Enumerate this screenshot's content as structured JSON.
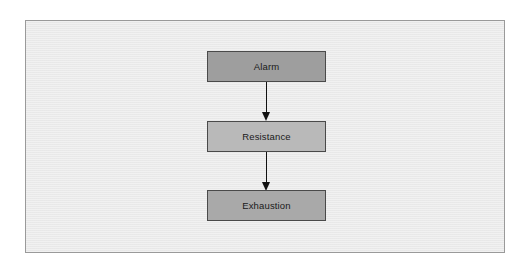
{
  "figure": {
    "panel": {
      "background_color": "#ebebeb",
      "border_color": "#9a9a9a"
    },
    "canvas_background_color": "#ffffff"
  },
  "chart_data": {
    "type": "diagram",
    "layout": "vertical-flowchart",
    "title": "",
    "nodes": [
      {
        "id": "alarm",
        "label": "Alarm",
        "order": 1,
        "fill_color": "#9e9e9e",
        "border_color": "#4a4a4a",
        "text_color": "#1a1a1a"
      },
      {
        "id": "resistance",
        "label": "Resistance",
        "order": 2,
        "fill_color": "#b9b9b9",
        "border_color": "#4a4a4a",
        "text_color": "#1a1a1a"
      },
      {
        "id": "exhaustion",
        "label": "Exhaustion",
        "order": 3,
        "fill_color": "#a9a9a9",
        "border_color": "#4a4a4a",
        "text_color": "#1a1a1a"
      }
    ],
    "edges": [
      {
        "id": "alarm-to-resistance",
        "from": "alarm",
        "to": "resistance",
        "direction": "down",
        "style": "solid-filled-arrowhead",
        "color": "#111111"
      },
      {
        "id": "resistance-to-exhaustion",
        "from": "resistance",
        "to": "exhaustion",
        "direction": "down",
        "style": "solid-filled-arrowhead",
        "color": "#111111"
      }
    ]
  }
}
